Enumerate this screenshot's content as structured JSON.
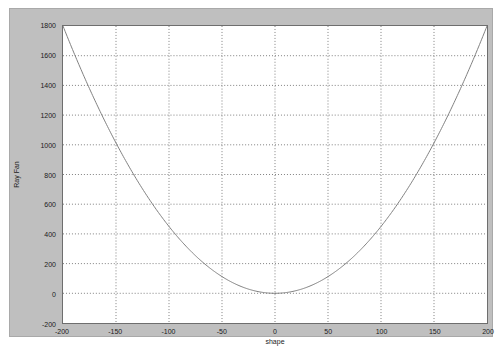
{
  "figure": {
    "background_color": "#bfbfbf",
    "axes_background_color": "#ffffff",
    "axes_border_color": "#6e6e6e"
  },
  "chart_data": {
    "type": "line",
    "title": "",
    "xlabel": "shape",
    "ylabel": "Ray Fan",
    "xlim": [
      -200,
      200
    ],
    "ylim": [
      -200,
      1800
    ],
    "xticks": [
      -200,
      -150,
      -100,
      -50,
      0,
      50,
      100,
      150,
      200
    ],
    "xtick_labels": [
      "-200",
      "-150",
      "-100",
      "-50",
      "0",
      "50",
      "100",
      "150",
      "200"
    ],
    "yticks": [
      -200,
      0,
      200,
      400,
      600,
      800,
      1000,
      1200,
      1400,
      1600,
      1800
    ],
    "ytick_labels": [
      "-200",
      "0",
      "200",
      "400",
      "600",
      "800",
      "1000",
      "1200",
      "1400",
      "1600",
      "1800"
    ],
    "grid": true,
    "grid_style": "dotted",
    "grid_color": "#808080",
    "legend": null,
    "series": [
      {
        "name": "Ray Fan",
        "color": "#808080",
        "line_width": 1,
        "x": [
          -200,
          -190,
          -180,
          -170,
          -160,
          -150,
          -140,
          -130,
          -120,
          -110,
          -100,
          -90,
          -80,
          -70,
          -60,
          -50,
          -40,
          -30,
          -20,
          -10,
          0,
          10,
          20,
          30,
          40,
          50,
          60,
          70,
          80,
          90,
          100,
          110,
          120,
          130,
          140,
          150,
          160,
          170,
          180,
          190,
          200
        ],
        "y": [
          1800,
          1624.5,
          1458,
          1300.5,
          1152,
          1012.5,
          882,
          760.5,
          648,
          544.5,
          450,
          364.5,
          288,
          220.5,
          162,
          112.5,
          72,
          40.5,
          18,
          4.5,
          0,
          4.5,
          18,
          40.5,
          72,
          112.5,
          162,
          220.5,
          288,
          364.5,
          450,
          544.5,
          648,
          760.5,
          882,
          1012.5,
          1152,
          1300.5,
          1458,
          1624.5,
          1800
        ]
      }
    ]
  }
}
